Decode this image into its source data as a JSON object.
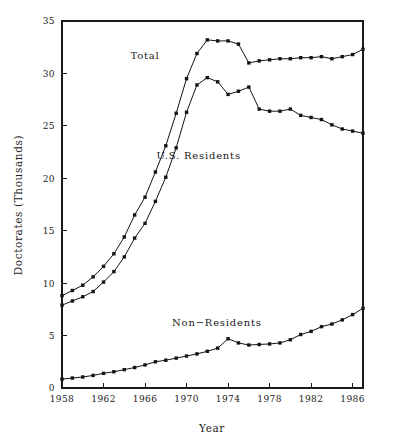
{
  "chart_data": {
    "type": "line",
    "title": "",
    "xlabel": "Year",
    "ylabel": "Doctorates (Thousands)",
    "xlim": [
      1958,
      1987
    ],
    "ylim": [
      0,
      35
    ],
    "xticks": [
      1958,
      1962,
      1966,
      1970,
      1974,
      1978,
      1982,
      1986
    ],
    "yticks": [
      0,
      5,
      10,
      15,
      20,
      25,
      30,
      35
    ],
    "xtick_labels": [
      "1958",
      "1962",
      "1966",
      "1970",
      "1974",
      "1978",
      "1982",
      "1986"
    ],
    "ytick_labels": [
      "0",
      "5",
      "10",
      "15",
      "20",
      "25",
      "30",
      "35"
    ],
    "grid": false,
    "legend_position": "inline-annotations",
    "x": [
      1958,
      1959,
      1960,
      1961,
      1962,
      1963,
      1964,
      1965,
      1966,
      1967,
      1968,
      1969,
      1970,
      1971,
      1972,
      1973,
      1974,
      1975,
      1976,
      1977,
      1978,
      1979,
      1980,
      1981,
      1982,
      1983,
      1984,
      1985,
      1986,
      1987
    ],
    "series": [
      {
        "name": "Total",
        "label": "Total",
        "label_x": 1964.6,
        "label_y": 31.4,
        "marker": "square",
        "values": [
          8.8,
          9.3,
          9.8,
          10.6,
          11.6,
          12.8,
          14.4,
          16.5,
          18.2,
          20.6,
          23.1,
          26.2,
          29.5,
          31.9,
          33.2,
          33.1,
          33.1,
          32.8,
          31.0,
          31.2,
          31.3,
          31.4,
          31.4,
          31.5,
          31.5,
          31.6,
          31.4,
          31.6,
          31.8,
          32.3
        ]
      },
      {
        "name": "U.S. Residents",
        "label": "U.S. Residents",
        "label_x": 1967.1,
        "label_y": 21.8,
        "marker": "square",
        "values": [
          7.9,
          8.3,
          8.7,
          9.2,
          10.1,
          11.1,
          12.5,
          14.3,
          15.7,
          17.8,
          20.1,
          22.9,
          26.3,
          28.9,
          29.6,
          29.2,
          28.0,
          28.3,
          28.7,
          26.6,
          26.4,
          26.4,
          26.6,
          26.0,
          25.8,
          25.6,
          25.1,
          24.7,
          24.5,
          24.3
        ]
      },
      {
        "name": "Non-Residents",
        "label": "Non−Residents",
        "label_x": 1968.6,
        "label_y": 5.9,
        "marker": "square",
        "values": [
          0.85,
          0.95,
          1.05,
          1.2,
          1.4,
          1.55,
          1.75,
          1.95,
          2.2,
          2.5,
          2.65,
          2.85,
          3.05,
          3.25,
          3.5,
          3.8,
          4.7,
          4.3,
          4.1,
          4.15,
          4.2,
          4.3,
          4.6,
          5.1,
          5.4,
          5.85,
          6.1,
          6.5,
          7.0,
          7.6
        ]
      }
    ]
  },
  "axes": {
    "x_title": "Year",
    "y_title": "Doctorates (Thousands)"
  }
}
